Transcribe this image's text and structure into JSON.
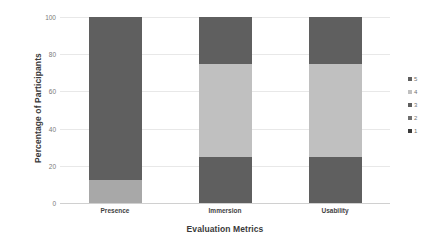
{
  "chart_data": {
    "type": "bar",
    "subtype": "stacked-bar-100-percent",
    "title": "",
    "xlabel": "Evaluation Metrics",
    "ylabel": "Percentage of Participants",
    "categories": [
      "Presence",
      "Immersion",
      "Usability"
    ],
    "ylim": [
      0,
      100
    ],
    "yticks": [
      0,
      20,
      40,
      60,
      80,
      100
    ],
    "ytick_labels": [
      "0",
      "20",
      "40",
      "60",
      "80",
      "100"
    ],
    "grid": true,
    "grid_axis": "y",
    "legend_position": "right",
    "legend_order": [
      "5",
      "4",
      "3",
      "2",
      "1"
    ],
    "series": [
      {
        "name": "1",
        "values": [
          0,
          0,
          0
        ],
        "color": "#3a3a3a"
      },
      {
        "name": "2",
        "values": [
          0,
          0,
          0
        ],
        "color": "#6e6e6e"
      },
      {
        "name": "3",
        "values": [
          0,
          25,
          25
        ],
        "color": "#5f5f5f"
      },
      {
        "name": "4",
        "values": [
          12.5,
          50,
          50
        ],
        "color": "#c0c0c0"
      },
      {
        "name": "5",
        "values": [
          87.5,
          25,
          25
        ],
        "color": "#5f5f5f"
      }
    ]
  },
  "axes": {
    "y_title": "Percentage of Participants",
    "x_title": "Evaluation Metrics",
    "y_tick_labels": [
      "100",
      "80",
      "60",
      "40",
      "20",
      "0"
    ],
    "x_tick_labels": [
      "Presence",
      "Immersion",
      "Usability"
    ]
  },
  "legend": {
    "items": [
      {
        "label": "5",
        "color": "#5f5f5f"
      },
      {
        "label": "4",
        "color": "#c0c0c0"
      },
      {
        "label": "3",
        "color": "#5f5f5f"
      },
      {
        "label": "2",
        "color": "#6e6e6e"
      },
      {
        "label": "1",
        "color": "#3a3a3a"
      }
    ]
  },
  "bars": [
    {
      "category": "Presence",
      "segments": [
        {
          "series": "4",
          "value": 12.5,
          "y0": 0,
          "y1": 12.5,
          "color": "#a8a8a8"
        },
        {
          "series": "5",
          "value": 87.5,
          "y0": 12.5,
          "y1": 100,
          "color": "#5f5f5f"
        }
      ]
    },
    {
      "category": "Immersion",
      "segments": [
        {
          "series": "3",
          "value": 25,
          "y0": 0,
          "y1": 25,
          "color": "#5f5f5f"
        },
        {
          "series": "4",
          "value": 50,
          "y0": 25,
          "y1": 75,
          "color": "#c0c0c0"
        },
        {
          "series": "5",
          "value": 25,
          "y0": 75,
          "y1": 100,
          "color": "#5f5f5f"
        }
      ]
    },
    {
      "category": "Usability",
      "segments": [
        {
          "series": "3",
          "value": 25,
          "y0": 0,
          "y1": 25,
          "color": "#5f5f5f"
        },
        {
          "series": "4",
          "value": 50,
          "y0": 25,
          "y1": 75,
          "color": "#c0c0c0"
        },
        {
          "series": "5",
          "value": 25,
          "y0": 75,
          "y1": 100,
          "color": "#5f5f5f"
        }
      ]
    }
  ],
  "colors": {
    "dark_gray": "#5f5f5f",
    "mid_gray": "#a8a8a8",
    "light_gray": "#c0c0c0",
    "gridline": "#e8e8e8",
    "background": "#ffffff"
  }
}
